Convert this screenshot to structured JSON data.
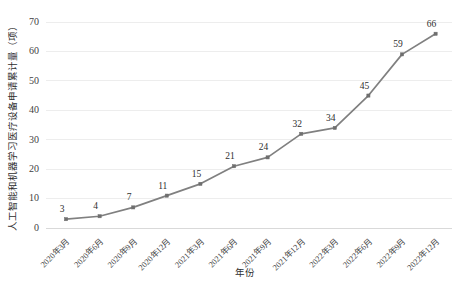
{
  "chart_data": {
    "type": "line",
    "title": "",
    "xlabel": "年份",
    "ylabel": "人工智能和机器学习医疗设备申请累计量（项）",
    "categories": [
      "2020年3月",
      "2020年6月",
      "2020年9月",
      "2020年12月",
      "2021年3月",
      "2021年6月",
      "2021年9月",
      "2021年12月",
      "2022年3月",
      "2022年6月",
      "2022年9月",
      "2022年12月"
    ],
    "values": [
      3,
      4,
      7,
      11,
      15,
      21,
      24,
      32,
      34,
      45,
      59,
      66
    ],
    "point_labels": [
      "3",
      "4",
      "7",
      "11",
      "15",
      "21",
      "24",
      "32",
      "34",
      "45",
      "59",
      "66"
    ],
    "ylim": [
      0,
      70
    ],
    "ytick_labels": [
      "0",
      "10",
      "20",
      "30",
      "40",
      "50",
      "60",
      "70"
    ],
    "ytick_values": [
      0,
      10,
      20,
      30,
      40,
      50,
      60,
      70
    ],
    "grid": true,
    "legend": "none",
    "series_color": "#808080",
    "marker_color": "#6f6f6f",
    "gridline_color": "#ededed",
    "background_color": "#ffffff",
    "x_tick_rotation": 45
  }
}
